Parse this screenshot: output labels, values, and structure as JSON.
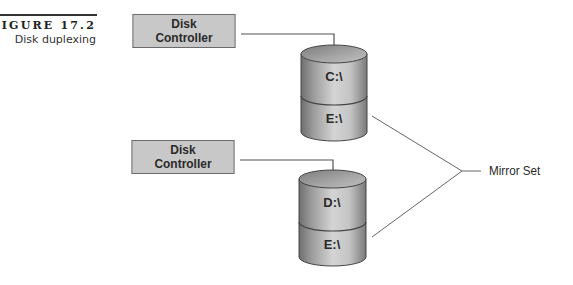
{
  "figure": {
    "number": "FIGURE 17.2",
    "title": "Disk duplexing"
  },
  "controllers": [
    {
      "line1": "Disk",
      "line2": "Controller"
    },
    {
      "line1": "Disk",
      "line2": "Controller"
    }
  ],
  "disks": [
    {
      "partitions": [
        "C:\\",
        "E:\\"
      ]
    },
    {
      "partitions": [
        "D:\\",
        "E:\\"
      ]
    }
  ],
  "mirror_label": "Mirror Set",
  "colors": {
    "controller_fill": "#c8c8c8",
    "controller_border": "#6a6a6a",
    "line": "#555555",
    "disk_dark": "#7a7a7a",
    "disk_light": "#d8d8d8"
  }
}
